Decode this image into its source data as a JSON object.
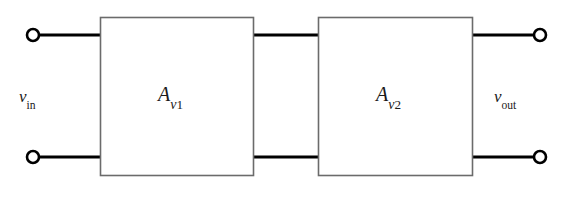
{
  "diagram": {
    "type": "block-diagram",
    "colors": {
      "wire": "#000000",
      "block_border": "#6b6b6b",
      "block_fill": "#ffffff",
      "terminal_stroke": "#000000",
      "background": "#ffffff",
      "text": "#1a1a1a"
    },
    "ports": {
      "input": {
        "label_main": "v",
        "label_sub": "in",
        "terminals": 2
      },
      "output": {
        "label_main": "v",
        "label_sub": "out",
        "terminals": 2
      }
    },
    "blocks": [
      {
        "name": "first-stage",
        "label_main": "A",
        "label_sub": "v",
        "label_subsub": "1",
        "x": 100,
        "y": 17,
        "width": 153,
        "height": 158
      },
      {
        "name": "second-stage",
        "label_main": "A",
        "label_sub": "v",
        "label_subsub": "2",
        "x": 318,
        "y": 17,
        "width": 154,
        "height": 158
      }
    ],
    "nets": {
      "top_wire_y": 35,
      "bottom_wire_y": 157,
      "left_terminal_x": 33,
      "right_terminal_x": 540,
      "terminal_radius": 6
    }
  }
}
